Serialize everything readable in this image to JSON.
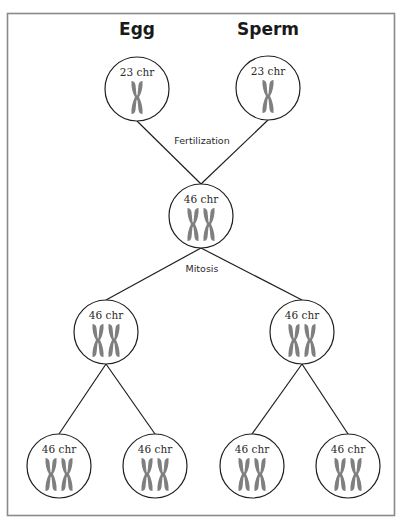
{
  "diagram": {
    "headers": {
      "egg": "Egg",
      "sperm": "Sperm"
    },
    "process_labels": {
      "fertilization": "Fertilization",
      "mitosis": "Mitosis"
    },
    "colors": {
      "chromosome": "#7f7f7f",
      "outline": "#1f1f1f",
      "frame": "#8a8a8a"
    },
    "cells": [
      {
        "id": "egg",
        "label": "23 chr",
        "chromosomes": 1
      },
      {
        "id": "sperm",
        "label": "23 chr",
        "chromosomes": 1
      },
      {
        "id": "zygote",
        "label": "46 chr",
        "chromosomes": 2
      },
      {
        "id": "daughter-left",
        "label": "46 chr",
        "chromosomes": 2
      },
      {
        "id": "daughter-right",
        "label": "46 chr",
        "chromosomes": 2
      },
      {
        "id": "granddaughter-1",
        "label": "46 chr",
        "chromosomes": 2
      },
      {
        "id": "granddaughter-2",
        "label": "46 chr",
        "chromosomes": 2
      },
      {
        "id": "granddaughter-3",
        "label": "46 chr",
        "chromosomes": 2
      },
      {
        "id": "granddaughter-4",
        "label": "46 chr",
        "chromosomes": 2
      }
    ]
  }
}
